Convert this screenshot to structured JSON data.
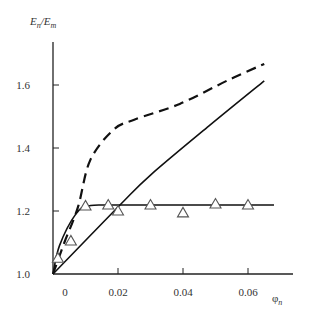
{
  "chart_data": {
    "type": "line",
    "title": "",
    "xlabel": "φn",
    "ylabel": "En/Em",
    "xlim": [
      0,
      0.07
    ],
    "ylim": [
      1.0,
      1.75
    ],
    "grid": false,
    "legend": null,
    "x_ticks": [
      0,
      0.02,
      0.04,
      0.06
    ],
    "x_tick_labels": [
      "0",
      "0.02",
      "0.04",
      "0.06"
    ],
    "y_ticks": [
      1.0,
      1.2,
      1.4,
      1.6
    ],
    "y_tick_labels": [
      "1.0",
      "1.2",
      "1.4",
      "1.6"
    ],
    "series": [
      {
        "name": "dashed curve",
        "style": "dashed",
        "x": [
          0,
          0.0035,
          0.0077,
          0.0114,
          0.0185,
          0.025,
          0.039,
          0.054,
          0.065
        ],
        "y": [
          1.0,
          1.1,
          1.213,
          1.36,
          1.457,
          1.49,
          1.54,
          1.616,
          1.667
        ]
      },
      {
        "name": "solid rising curve",
        "style": "solid",
        "x": [
          0,
          0.0206,
          0.03,
          0.048,
          0.065
        ],
        "y": [
          1.0,
          1.219,
          1.314,
          1.47,
          1.613
        ]
      },
      {
        "name": "solid saturation curve",
        "style": "solid",
        "x": [
          0,
          0.002,
          0.007,
          0.011,
          0.0206,
          0.068
        ],
        "y": [
          1.0,
          1.09,
          1.19,
          1.216,
          1.219,
          1.219
        ]
      },
      {
        "name": "experimental points",
        "style": "markers",
        "marker": "triangle-open",
        "x": [
          0.0015,
          0.0055,
          0.01,
          0.017,
          0.02,
          0.03,
          0.04,
          0.05,
          0.06
        ],
        "y": [
          1.05,
          1.105,
          1.216,
          1.219,
          1.2,
          1.219,
          1.194,
          1.222,
          1.219
        ]
      }
    ]
  },
  "labels": {
    "y_axis_main": "E",
    "y_axis_sub1": "n",
    "y_axis_slash": "/E",
    "y_axis_sub2": "m",
    "x_axis_main": "φ",
    "x_axis_sub": "n"
  }
}
